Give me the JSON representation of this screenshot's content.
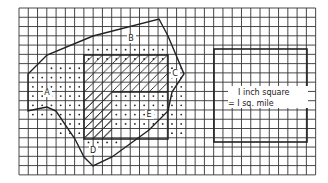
{
  "diagram": {
    "grid": {
      "x": 19,
      "y": 8,
      "cols": 32,
      "rows": 18,
      "cell": 9.27
    },
    "regions": [
      {
        "label": "A",
        "x": 47,
        "y": 95
      },
      {
        "label": "B",
        "x": 131,
        "y": 41
      },
      {
        "label": "C",
        "x": 175,
        "y": 76
      },
      {
        "label": "D",
        "x": 93,
        "y": 153
      },
      {
        "label": "E",
        "x": 149,
        "y": 117
      }
    ],
    "legend": {
      "line1": "I inch square",
      "line2": "= I sq. mile"
    },
    "colors": {
      "line": "#222222",
      "background": "#ffffff"
    }
  }
}
